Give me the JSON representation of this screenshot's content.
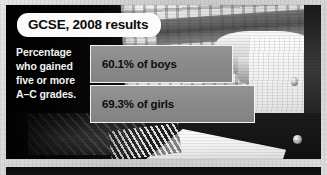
{
  "chart_data": {
    "type": "bar",
    "title": "GCSE, 2008 results",
    "subtitle": "",
    "caption": "Percentage who gained five or more A–C grades.",
    "xlabel": "",
    "ylabel": "",
    "orientation": "horizontal",
    "grid": false,
    "legend": "none",
    "xlim": [
      0,
      100
    ],
    "unit": "%",
    "categories": [
      "boys",
      "girls"
    ],
    "values": [
      60.1,
      69.3
    ],
    "series": [
      {
        "name": "Percentage gaining five or more A-C grades",
        "values": [
          60.1,
          69.3
        ]
      }
    ],
    "bars": [
      {
        "label": "60.1% of boys",
        "value": 60.1,
        "category": "boys",
        "width_px": 143
      },
      {
        "label": "69.3% of girls",
        "value": 69.3,
        "category": "girls",
        "width_px": 165
      }
    ],
    "colors": {
      "bar_fill": "#8a8a8a",
      "bar_border": "#f3f3f3",
      "panel_background": "#0a0a0a",
      "title_pill": "#fbfbfb",
      "title_text": "#0b0b0b",
      "caption_text": "#f2f2f2",
      "bar_label_text": "#0d0d0d",
      "page_background": "#d2d2d2"
    }
  },
  "figure": {
    "title": "GCSE, 2008 results",
    "caption_lines": [
      "Percentage",
      "who gained",
      "five or more",
      "A–C grades."
    ],
    "photo_description": "grayscale photo of a student in a checked sleeve writing in a spiral notebook"
  }
}
